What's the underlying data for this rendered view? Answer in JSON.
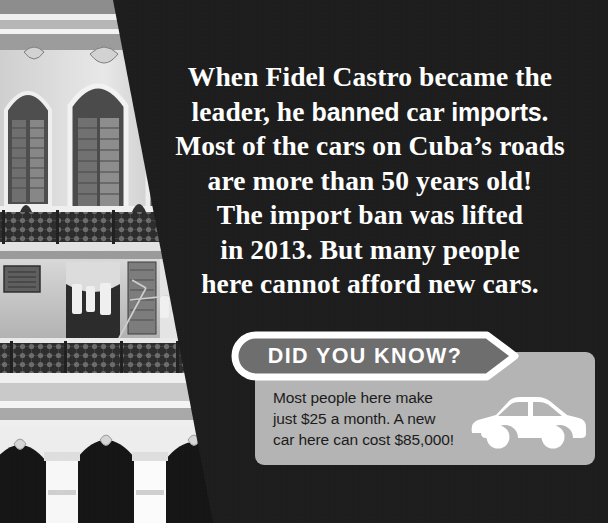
{
  "page": {
    "background_color": "#1c1c1c",
    "width": 608,
    "height": 523
  },
  "photo": {
    "name": "havana-building-photo",
    "description": "Black and white photograph of an ornate colonial building facade in Cuba with wrought-iron balconies, shuttered arched windows, hanging laundry, and an arched colonnade at street level",
    "treatment": "grayscale"
  },
  "headline": {
    "line1": "When Fidel Castro became the",
    "line2_pre": "leader, he ",
    "line2_bold1": "banned",
    "line2_mid": " car ",
    "line2_bold2": "imports",
    "line2_post": ".",
    "line3": "Most of the cars on Cuba’s roads",
    "line4": "are more than 50 years old!",
    "line5": "The import ban was lifted",
    "line6": "in 2013. But many people",
    "line7": "here cannot afford new cars.",
    "color": "#ffffff"
  },
  "fact_card": {
    "banner_label": "DID YOU KNOW?",
    "banner_fill": "#6e6e6e",
    "banner_border": "#ffffff",
    "panel_color": "#b4b4b4",
    "body_line1": "Most people here make",
    "body_line2": "just $25 a month. A new",
    "body_line3": "car here can cost $85,000!",
    "body_color": "#1c1c1c",
    "icon_name": "car-icon",
    "icon_color": "#ffffff"
  }
}
